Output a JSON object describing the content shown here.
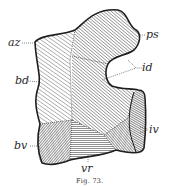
{
  "figure": {
    "caption": "Fig. 73.",
    "labels": {
      "az": "az",
      "ps": "ps",
      "id": "id",
      "bd": "bd",
      "iv": "iv",
      "bv": "bv",
      "vr": "vr"
    },
    "colors": {
      "ink": "#2a2a2a",
      "paper": "#ffffff"
    }
  }
}
